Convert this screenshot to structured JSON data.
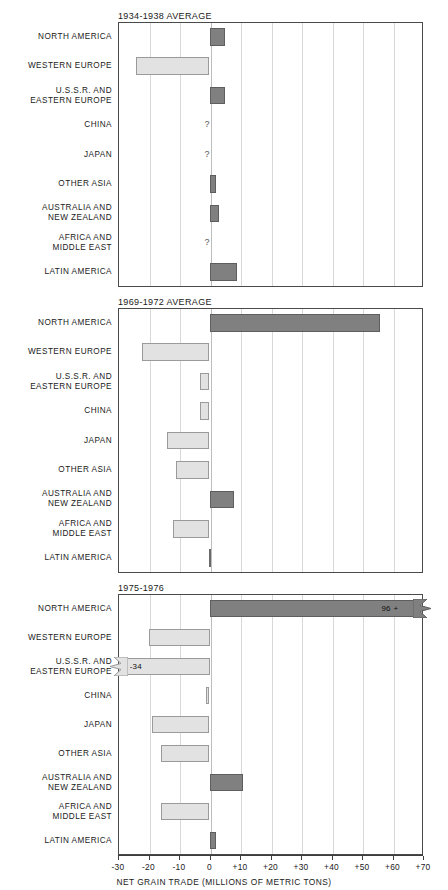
{
  "chart_data": {
    "type": "bar",
    "orientation": "horizontal",
    "title": "",
    "xlabel": "NET GRAIN TRADE (MILLIONS OF METRIC TONS)",
    "ylabel": "",
    "xlim": [
      -30,
      70
    ],
    "grid": true,
    "legend": null,
    "xticks": [
      "-30",
      "-20",
      "-10",
      "0",
      "+10",
      "+20",
      "+30",
      "+40",
      "+50",
      "+60",
      "+70"
    ],
    "xtick_values": [
      -30,
      -20,
      -10,
      0,
      10,
      20,
      30,
      40,
      50,
      60,
      70
    ],
    "categories": [
      "NORTH AMERICA",
      "WESTERN EUROPE",
      "U.S.S.R. AND\nEASTERN EUROPE",
      "CHINA",
      "JAPAN",
      "OTHER ASIA",
      "AUSTRALIA AND\nNEW ZEALAND",
      "AFRICA AND\nMIDDLE EAST",
      "LATIN AMERICA"
    ],
    "panels": [
      {
        "title": "1934-1938 AVERAGE",
        "values": [
          5,
          -24,
          5,
          null,
          null,
          2,
          3,
          null,
          9
        ],
        "notes": [
          "",
          "",
          "",
          "?",
          "?",
          "",
          "",
          "?",
          ""
        ]
      },
      {
        "title": "1969-1972 AVERAGE",
        "values": [
          56,
          -22,
          -3,
          -3,
          -14,
          -11,
          8,
          -12,
          -0.5
        ],
        "notes": [
          "",
          "",
          "",
          "",
          "",
          "",
          "",
          "",
          ""
        ]
      },
      {
        "title": "1975-1976",
        "values": [
          96,
          -20,
          -34,
          -1,
          -19,
          -16,
          11,
          -16,
          2
        ],
        "notes": [
          "96 +",
          "",
          "-34",
          "",
          "",
          "",
          "",
          "",
          ""
        ],
        "offscale": [
          true,
          false,
          true,
          false,
          false,
          false,
          false,
          false,
          false
        ]
      }
    ]
  },
  "axis": {
    "title": "NET GRAIN TRADE (MILLIONS OF METRIC TONS)",
    "ticks": [
      "-30",
      "-20",
      "-10",
      "0",
      "+10",
      "+20",
      "+30",
      "+40",
      "+50",
      "+60",
      "+70"
    ]
  },
  "panel_titles": {
    "p1": "1934-1938 AVERAGE",
    "p2": "1969-1972 AVERAGE",
    "p3": "1975-1976"
  },
  "labels": {
    "north_america": "NORTH AMERICA",
    "western_europe": "WESTERN EUROPE",
    "ussr": "U.S.S.R. AND\nEASTERN EUROPE",
    "china": "CHINA",
    "japan": "JAPAN",
    "other_asia": "OTHER ASIA",
    "australia": "AUSTRALIA AND\nNEW ZEALAND",
    "africa": "AFRICA AND\nMIDDLE EAST",
    "latin_america": "LATIN AMERICA"
  },
  "annotations": {
    "unknown": "?",
    "na_1975": "96 +",
    "ussr_1975": "-34"
  },
  "colors": {
    "exporter_fill": "#808080",
    "importer_fill": "#e2e2e2",
    "grid": "#d8d8d8",
    "frame": "#4a4a4a",
    "text": "#1a1a1a"
  }
}
